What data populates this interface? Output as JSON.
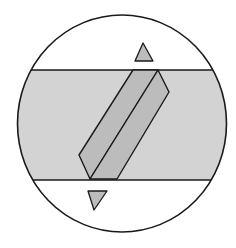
{
  "figure": {
    "type": "optical-field-of-view-diagram",
    "colors": {
      "background": "#ffffff",
      "outline": "#1a1a1a",
      "band_fill": "#d3d3d3",
      "crystal_fill": "#bcbcbc",
      "marker_fill": "#bcbcbc"
    },
    "field_circle": {
      "cx": 122,
      "cy": 123.5,
      "rx": 104.5,
      "ry": 108.5
    },
    "band": {
      "y_top": 70,
      "y_bottom": 180
    },
    "crystal": {
      "left_face": "133,70 158,70 90,179 79,155",
      "right_face": "158,70 169,92 117,179 90,179"
    },
    "markers": {
      "top_triangle": "143,43 135,61 153,61",
      "bottom_triangle": "88,191 107,191 94,210"
    }
  }
}
